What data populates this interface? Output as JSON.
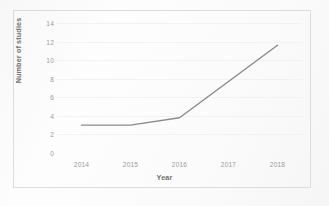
{
  "figure": {
    "background_color": "#fdfdfd",
    "frame_color": "#dcdcdc",
    "axis_text_color": "#9b9b9b",
    "axis_title_color": "#6f6f6f",
    "gridline_color": "#f2f2f2"
  },
  "chart_data": {
    "type": "line",
    "title": "",
    "xlabel": "Year",
    "ylabel": "Number of studies",
    "categories": [
      "2014",
      "2015",
      "2016",
      "2017",
      "2018"
    ],
    "x": [
      2014,
      2015,
      2016,
      2017,
      2018
    ],
    "values": [
      3,
      3,
      3.8,
      7.7,
      11.6
    ],
    "series": [
      {
        "name": "Number of studies",
        "color": "#8a8a8a",
        "values": [
          3,
          3,
          3.8,
          7.7,
          11.6
        ]
      }
    ],
    "ylim": [
      0,
      14
    ],
    "yticks": [
      0,
      2,
      4,
      6,
      8,
      10,
      12,
      14
    ],
    "ytick_labels": [
      "0",
      "2",
      "4",
      "6",
      "8",
      "10",
      "12",
      "14"
    ],
    "xtick_labels": [
      "2014",
      "2015",
      "2016",
      "2017",
      "2018"
    ],
    "grid": true,
    "grid_axis": "y",
    "legend": false,
    "legend_position": "none",
    "markers": false,
    "line_width": 1.4,
    "annotations": []
  }
}
